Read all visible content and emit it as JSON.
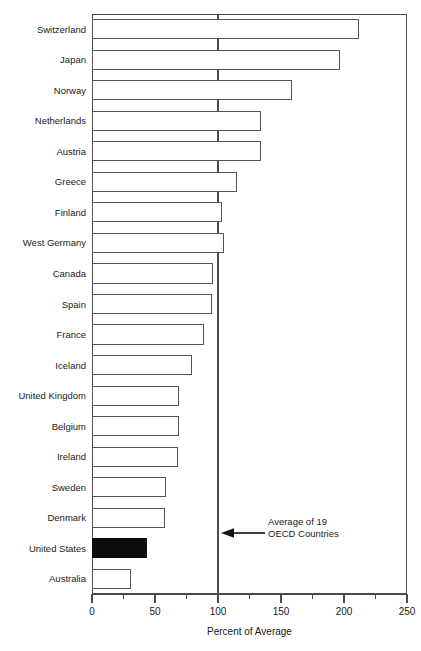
{
  "chart_data": {
    "type": "bar",
    "orientation": "horizontal",
    "title": "",
    "xlabel": "Percent of Average",
    "ylabel": "",
    "xlim": [
      0,
      250
    ],
    "xticks": [
      0,
      50,
      100,
      150,
      200,
      250
    ],
    "xtick_labels": [
      "0",
      "50",
      "100",
      "150",
      "200",
      "250"
    ],
    "minor_xticks": [
      25,
      75,
      125,
      175,
      225
    ],
    "grid": false,
    "legend": null,
    "reference_line": {
      "value": 100,
      "label": "Average of 19 OECD Countries"
    },
    "categories": [
      "Switzerland",
      "Japan",
      "Norway",
      "Netherlands",
      "Austria",
      "Greece",
      "Finland",
      "West Germany",
      "Canada",
      "Spain",
      "France",
      "Iceland",
      "United Kingdom",
      "Belgium",
      "Ireland",
      "Sweden",
      "Denmark",
      "United States",
      "Australia"
    ],
    "values": [
      212,
      197,
      159,
      134,
      134,
      115,
      103,
      105,
      96,
      95,
      89,
      79,
      69,
      69,
      68,
      59,
      58,
      44,
      31
    ],
    "highlighted": [
      "United States"
    ],
    "highlight_style": "filled-black"
  },
  "annotation": {
    "line1": "Average of 19",
    "line2": "OECD Countries",
    "arrow_direction": "left"
  },
  "axis": {
    "x_title": "Percent of Average"
  },
  "colors": {
    "bar_fill": "#ffffff",
    "bar_stroke": "#555555",
    "highlight_fill": "#0d0d0d",
    "axis": "#4a4a4a",
    "text": "#1a1a1a",
    "background": "#ffffff"
  }
}
